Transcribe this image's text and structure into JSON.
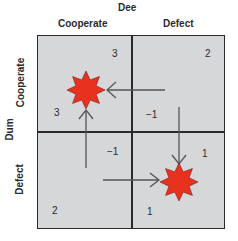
{
  "column_player": {
    "label": "Dee",
    "strategies": [
      "Cooperate",
      "Defect"
    ]
  },
  "row_player": {
    "label": "Dum",
    "strategies": [
      "Cooperate",
      "Defect"
    ]
  },
  "payoffs": {
    "cc": {
      "dee": "3",
      "dum": "3"
    },
    "cd": {
      "dee": "2",
      "dum": "−1"
    },
    "dc": {
      "dee": "−1",
      "dum": "2"
    },
    "dd": {
      "dee": "1",
      "dum": "1"
    }
  },
  "equilibrium_markers": [
    "cooperate-cooperate",
    "defect-defect"
  ],
  "colors": {
    "cell": "#d6d7d9",
    "star": "#e8311f",
    "arrow": "#555555"
  }
}
